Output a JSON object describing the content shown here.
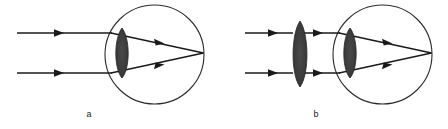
{
  "figure": {
    "type": "optics-ray-diagram",
    "background_color": "#ffffff",
    "stroke_color": "#1a1a1a",
    "lens_fill_color": "#3b3b3b",
    "eyeball_stroke_color": "#2b2b2b",
    "panels": [
      {
        "id": "a",
        "label": "a",
        "label_x": 89,
        "label_y": 114,
        "eyeball": {
          "cx": 154.5,
          "cy": 54.5,
          "r": 49.5
        },
        "eye_lens": {
          "cx": 122,
          "cy": 53,
          "rx": 9.5,
          "ry": 25
        },
        "focus_point": {
          "x": 203,
          "y": 53
        },
        "incoming_rays": [
          {
            "x1": 17,
            "y1": 33,
            "x2": 111,
            "y2": 33,
            "arrow_x": 60,
            "arrow_y": 33
          },
          {
            "x1": 17,
            "y1": 73,
            "x2": 111,
            "y2": 73,
            "arrow_x": 60,
            "arrow_y": 73
          }
        ],
        "refracted_rays": [
          {
            "x1": 111,
            "y1": 33,
            "x2": 203,
            "y2": 53,
            "arrow_t": 0.56
          },
          {
            "x1": 111,
            "y1": 73,
            "x2": 203,
            "y2": 53,
            "arrow_t": 0.56
          }
        ]
      },
      {
        "id": "b",
        "label": "b",
        "label_x": 316,
        "label_y": 114,
        "eyeball": {
          "cx": 382.5,
          "cy": 54.5,
          "r": 49.5
        },
        "eye_lens": {
          "cx": 350,
          "cy": 53,
          "rx": 9.5,
          "ry": 25
        },
        "focus_point": {
          "x": 431,
          "y": 53
        },
        "external_lens": {
          "cx": 300,
          "cy": 54,
          "rx": 9.5,
          "ry": 33
        },
        "incoming_rays": [
          {
            "x1": 245,
            "y1": 33,
            "x2": 291,
            "y2": 33,
            "arrow_x": 274,
            "arrow_y": 33
          },
          {
            "x1": 245,
            "y1": 73,
            "x2": 291,
            "y2": 73,
            "arrow_x": 274,
            "arrow_y": 73
          }
        ],
        "middle_rays": [
          {
            "x1": 300,
            "y1": 33,
            "x2": 339,
            "y2": 33,
            "arrow_x": 320,
            "arrow_y": 33
          },
          {
            "x1": 300,
            "y1": 73,
            "x2": 339,
            "y2": 73,
            "arrow_x": 320,
            "arrow_y": 73
          }
        ],
        "refracted_rays": [
          {
            "x1": 339,
            "y1": 33,
            "x2": 431,
            "y2": 53,
            "arrow_t": 0.56
          },
          {
            "x1": 339,
            "y1": 73,
            "x2": 431,
            "y2": 53,
            "arrow_t": 0.56
          }
        ]
      }
    ]
  }
}
